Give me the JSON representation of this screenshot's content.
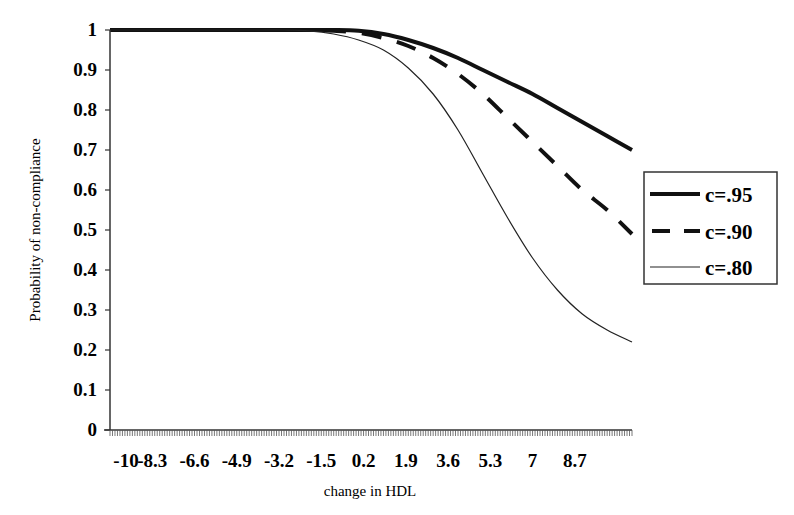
{
  "chart_data": {
    "type": "line",
    "title": "",
    "xlabel": "change in HDL",
    "ylabel": "Probability of non-compliance",
    "x_tick_labels": [
      "-10",
      "-8.3",
      "-6.6",
      "-4.9",
      "-3.2",
      "-1.5",
      "0.2",
      "1.9",
      "3.6",
      "5.3",
      "7",
      "8.7"
    ],
    "y_tick_labels": [
      "0",
      "0.1",
      "0.2",
      "0.3",
      "0.4",
      "0.5",
      "0.6",
      "0.7",
      "0.8",
      "0.9",
      "1"
    ],
    "xlim": [
      -10,
      11
    ],
    "ylim": [
      0,
      1
    ],
    "grid": false,
    "legend_position": "right",
    "x": [
      -10,
      -8,
      -6,
      -4,
      -3,
      -2,
      -1,
      0,
      1,
      2,
      3,
      4,
      5,
      6,
      7,
      8,
      9,
      10,
      11
    ],
    "series": [
      {
        "name": "c=.95",
        "style": "solid-thick",
        "values": [
          1,
          1,
          1,
          1,
          1,
          1,
          1,
          0.998,
          0.99,
          0.975,
          0.955,
          0.93,
          0.9,
          0.87,
          0.84,
          0.805,
          0.77,
          0.735,
          0.7
        ]
      },
      {
        "name": "c=.90",
        "style": "dashed",
        "values": [
          1,
          1,
          1,
          1,
          1,
          1,
          0.998,
          0.993,
          0.98,
          0.96,
          0.93,
          0.89,
          0.84,
          0.78,
          0.72,
          0.66,
          0.6,
          0.55,
          0.49
        ]
      },
      {
        "name": "c=.80",
        "style": "solid-thin",
        "values": [
          1,
          1,
          1,
          1,
          1,
          0.998,
          0.99,
          0.975,
          0.95,
          0.905,
          0.84,
          0.75,
          0.64,
          0.53,
          0.43,
          0.35,
          0.29,
          0.25,
          0.22
        ]
      }
    ]
  },
  "legend": {
    "items": [
      {
        "label": "c=.95"
      },
      {
        "label": "c=.90"
      },
      {
        "label": "c=.80"
      }
    ]
  },
  "axes": {
    "xlabel": "change in HDL",
    "ylabel": "Probability of non-compliance"
  }
}
